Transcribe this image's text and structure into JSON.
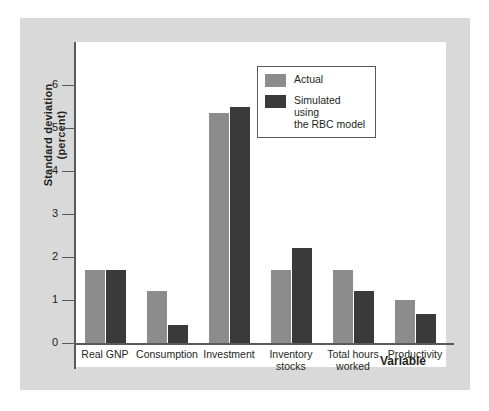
{
  "chart_data": {
    "type": "bar",
    "title": "",
    "xlabel": "Variable",
    "ylabel": "Standard deviation (percent)",
    "ylabel_line1": "Standard deviation",
    "ylabel_line2": "(percent)",
    "ylim": [
      0,
      7
    ],
    "yticks": [
      "0",
      "1",
      "2",
      "3",
      "4",
      "5",
      "6"
    ],
    "ytick_values": [
      0,
      1,
      2,
      3,
      4,
      5,
      6
    ],
    "grid": false,
    "legend_position": "top-right",
    "categories": [
      "Real GNP",
      "Consumption",
      "Investment",
      "Inventory\nstocks",
      "Total hours\nworked",
      "Productivity"
    ],
    "series": [
      {
        "name": "Actual",
        "color": "#8c8c8c",
        "values": [
          1.7,
          1.2,
          5.35,
          1.7,
          1.7,
          1.0
        ]
      },
      {
        "name": "Simulated using\nthe RBC model",
        "color": "#3a3a3a",
        "values": [
          1.7,
          0.43,
          5.5,
          2.2,
          1.2,
          0.67
        ]
      }
    ]
  },
  "legend": {
    "items": [
      {
        "label": "Actual",
        "swatch": "actual"
      },
      {
        "label": "Simulated using\nthe RBC model",
        "swatch": "sim"
      }
    ]
  },
  "colors": {
    "actual": "#8c8c8c",
    "simulated": "#3a3a3a",
    "panel_background": "#d9d9d9",
    "plot_background": "#ffffff",
    "axis": "#58595b",
    "text": "#231f20"
  }
}
